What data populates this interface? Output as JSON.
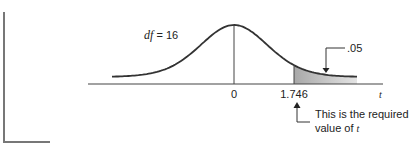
{
  "diagram": {
    "type": "t-distribution",
    "df_label_var": "df",
    "df_label_eq": " = 16",
    "tail_area_label": ".05",
    "ticks": [
      "0",
      "1.746"
    ],
    "axis_label": "t",
    "critical_value": 1.746,
    "tail_area": 0.05,
    "degrees_of_freedom": 16,
    "annotation_line1": "This is the required",
    "annotation_line2_text": "value of ",
    "annotation_line2_var": "t",
    "colors": {
      "ink": "#333333",
      "shade": "#bdbdbd",
      "bracket": "#777777"
    }
  }
}
